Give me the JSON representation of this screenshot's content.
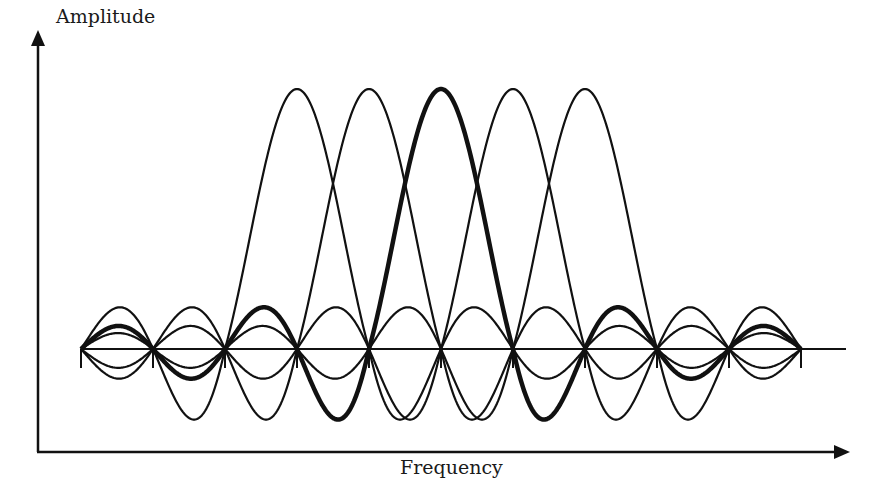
{
  "diagram": {
    "title": "",
    "y_axis_label": "Amplitude",
    "x_axis_label": "Frequency",
    "colors": {
      "stroke": "#111111",
      "background": "#ffffff"
    },
    "baseline": {
      "y": 349,
      "x_start": 81,
      "x_end": 846
    },
    "node_spacing_px": 72,
    "nodes_x": [
      81,
      153,
      225,
      297,
      369,
      441,
      513,
      585,
      657,
      729,
      801
    ],
    "main_lobe_peak_y": 89,
    "subcarriers": [
      {
        "name": "subcarrier-1",
        "center_x": 297,
        "highlighted": false
      },
      {
        "name": "subcarrier-2",
        "center_x": 369,
        "highlighted": false
      },
      {
        "name": "subcarrier-3",
        "center_x": 441,
        "highlighted": true
      },
      {
        "name": "subcarrier-4",
        "center_x": 513,
        "highlighted": false
      },
      {
        "name": "subcarrier-5",
        "center_x": 585,
        "highlighted": false
      }
    ],
    "curve_span_x": [
      81,
      801
    ],
    "axes": {
      "origin": {
        "x": 38,
        "y": 452
      },
      "y_axis_top": 30,
      "x_axis_right": 850
    }
  }
}
